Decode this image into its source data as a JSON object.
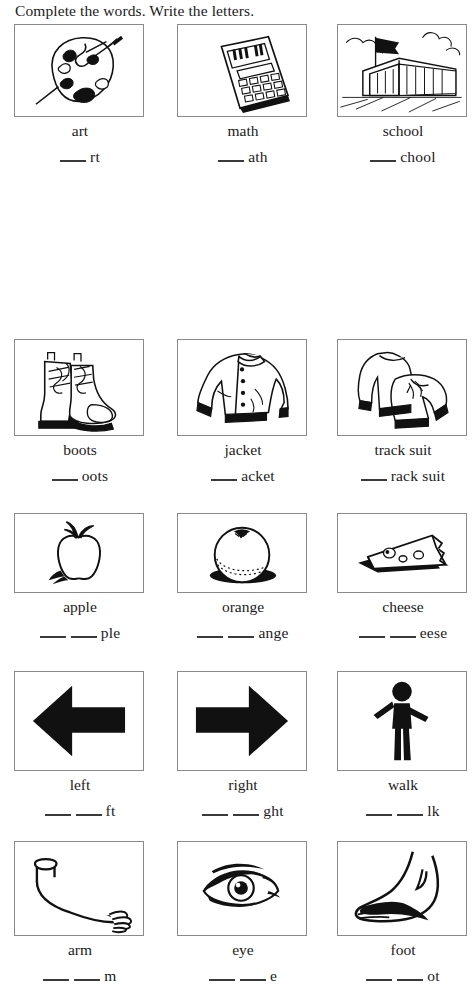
{
  "instruction": "Complete the words. Write the letters.",
  "rows": [
    {
      "row_index": 1,
      "items": [
        {
          "word": "art",
          "blanks": 1,
          "tail": "rt",
          "picture": "paint-palette"
        },
        {
          "word": "math",
          "blanks": 1,
          "tail": "ath",
          "picture": "calculator"
        },
        {
          "word": "school",
          "blanks": 1,
          "tail": "chool",
          "picture": "school-building"
        }
      ]
    },
    {
      "row_index": 2,
      "items": [
        {
          "word": "boots",
          "blanks": 1,
          "tail": "oots",
          "picture": "boots"
        },
        {
          "word": "jacket",
          "blanks": 1,
          "tail": "acket",
          "picture": "jacket"
        },
        {
          "word": "track suit",
          "blanks": 1,
          "tail": "rack suit",
          "picture": "track-suit"
        }
      ]
    },
    {
      "row_index": 3,
      "items": [
        {
          "word": "apple",
          "blanks": 2,
          "tail": "ple",
          "picture": "apple"
        },
        {
          "word": "orange",
          "blanks": 2,
          "tail": "ange",
          "picture": "orange"
        },
        {
          "word": "cheese",
          "blanks": 2,
          "tail": "eese",
          "picture": "cheese-wedge"
        }
      ]
    },
    {
      "row_index": 4,
      "items": [
        {
          "word": "left",
          "blanks": 2,
          "tail": "ft",
          "picture": "left-arrow"
        },
        {
          "word": "right",
          "blanks": 2,
          "tail": "ght",
          "picture": "right-arrow"
        },
        {
          "word": "walk",
          "blanks": 2,
          "tail": "lk",
          "picture": "walking-person"
        }
      ]
    },
    {
      "row_index": 5,
      "items": [
        {
          "word": "arm",
          "blanks": 2,
          "tail": "m",
          "picture": "arm"
        },
        {
          "word": "eye",
          "blanks": 2,
          "tail": "e",
          "picture": "eye"
        },
        {
          "word": "foot",
          "blanks": 2,
          "tail": "ot",
          "picture": "foot"
        }
      ]
    }
  ],
  "colors": {
    "ink": "#1b1b1b",
    "box_border": "#8a8a8a",
    "blank_line": "#3a3a3a",
    "paper": "#ffffff"
  }
}
